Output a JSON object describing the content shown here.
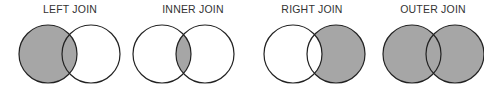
{
  "diagrams": [
    {
      "label": "LEFT JOIN",
      "shaded": "left"
    },
    {
      "label": "INNER JOIN",
      "shaded": "intersection"
    },
    {
      "label": "RIGHT JOIN",
      "shaded": "right"
    },
    {
      "label": "OUTER JOIN",
      "shaded": "both"
    }
  ],
  "colors": {
    "fill": "#a6a6a6",
    "stroke": "#222222",
    "background": "#ffffff"
  }
}
